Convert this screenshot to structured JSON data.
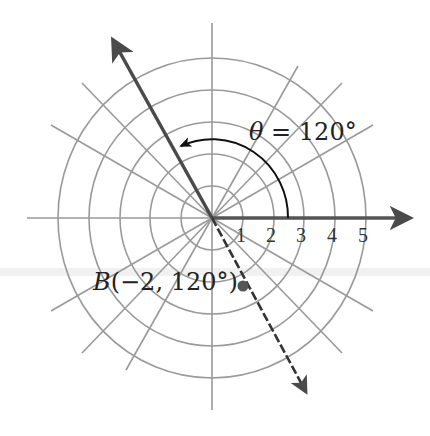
{
  "figure": {
    "type": "polar-coordinate-diagram",
    "angle_label": {
      "symbol": "θ",
      "equals": "=",
      "value": "120°"
    },
    "point": {
      "name": "B",
      "coords_text": "(−2, 120°)",
      "r": -2,
      "theta_deg": 120
    },
    "axis_ticks": [
      "1",
      "2",
      "3",
      "4",
      "5"
    ],
    "rings": [
      1,
      2,
      3,
      4,
      5
    ],
    "spoke_angles_deg": [
      0,
      30,
      45,
      60,
      90,
      120,
      135,
      150,
      180,
      210,
      225,
      240,
      270,
      300,
      315,
      330
    ],
    "colors": {
      "grid": "#9a9a9a",
      "axis": "#555555",
      "ray": "#4a4a4a",
      "arc": "#111111",
      "point": "#555555",
      "text": "#222222"
    }
  }
}
